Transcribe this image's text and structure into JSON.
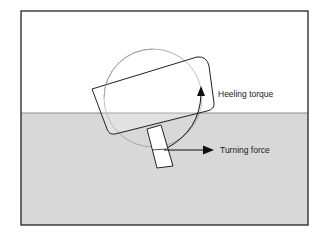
{
  "diagram": {
    "type": "physics-illustration",
    "labels": {
      "heeling_torque": "Heeling torque",
      "turning_force": "Turning force"
    },
    "colors": {
      "background": "#ffffff",
      "water": "#d8d8d8",
      "frame": "#222222",
      "hull_fill": "#ffffff",
      "hull_stroke": "#222222",
      "circle_stroke": "#9a9a9a",
      "arrow": "#111111"
    }
  }
}
